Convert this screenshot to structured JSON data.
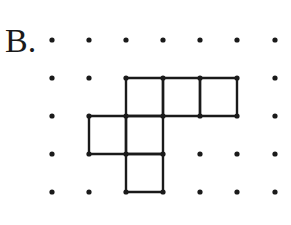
{
  "label": "B.",
  "grid": {
    "cols": 7,
    "rows": 5,
    "x": [
      52,
      89,
      126,
      163,
      200,
      237,
      275
    ],
    "y": [
      40,
      78,
      116,
      154,
      192
    ],
    "dot_radius": 2.6,
    "color": "#1a1a1a"
  },
  "shape": {
    "description": "cube net of 6 unit squares",
    "stroke": "#1a1a1a",
    "stroke_width": 2.4,
    "cells": [
      {
        "col": 2,
        "row": 1
      },
      {
        "col": 3,
        "row": 1
      },
      {
        "col": 4,
        "row": 1
      },
      {
        "col": 1,
        "row": 2
      },
      {
        "col": 2,
        "row": 2
      },
      {
        "col": 2,
        "row": 3
      }
    ]
  }
}
